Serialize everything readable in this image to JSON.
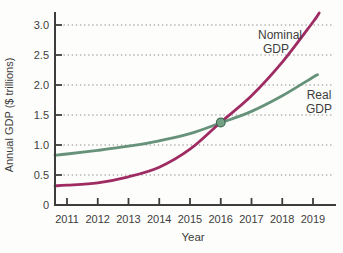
{
  "chart_data": {
    "type": "line",
    "title": "",
    "xlabel": "Year",
    "ylabel": "Annual GDP ($ trillions)",
    "x_tick_labels": [
      "2011",
      "2012",
      "2013",
      "2014",
      "2015",
      "2016",
      "2017",
      "2018",
      "2019"
    ],
    "x_tick_values": [
      2011,
      2012,
      2013,
      2014,
      2015,
      2016,
      2017,
      2018,
      2019
    ],
    "y_tick_labels": [
      "0",
      "0.5",
      "1.0",
      "1.5",
      "2.0",
      "2.5",
      "3.0"
    ],
    "y_tick_values": [
      0,
      0.5,
      1,
      1.5,
      2,
      2.5,
      3
    ],
    "xlim": [
      2010.6,
      2019.75
    ],
    "ylim": [
      0,
      3.22
    ],
    "grid": "horizontal-dotted",
    "legend_position": "inline-labels",
    "series": [
      {
        "name": "Nominal GDP",
        "color": "#9e2c63",
        "x": [
          2010.61,
          2011,
          2012,
          2013,
          2014,
          2015,
          2016,
          2017,
          2018,
          2019,
          2019.2
        ],
        "values": [
          0.32,
          0.33,
          0.37,
          0.47,
          0.63,
          0.93,
          1.38,
          1.82,
          2.38,
          3.05,
          3.2
        ]
      },
      {
        "name": "Real GDP",
        "color": "#67927a",
        "x": [
          2010.61,
          2011,
          2012,
          2013,
          2014,
          2015,
          2016,
          2017,
          2018,
          2019,
          2019.15
        ],
        "values": [
          0.83,
          0.85,
          0.91,
          0.98,
          1.07,
          1.19,
          1.37,
          1.56,
          1.82,
          2.13,
          2.17
        ]
      }
    ],
    "intersection_marker": {
      "x": 2016,
      "y": 1.375
    }
  },
  "labels": {
    "y_axis": "Annual GDP ($ trillions)",
    "x_axis": "Year",
    "nominal": {
      "line1": "Nominal",
      "line2": "GDP"
    },
    "real": {
      "line1": "Real",
      "line2": "GDP"
    }
  },
  "colors": {
    "nominal_line": "#9e2c63",
    "real_line": "#67927a",
    "marker_fill": "#74a184",
    "marker_stroke": "#3f6e55",
    "axis": "#3d3d3d",
    "grid": "#8f8f8f",
    "text": "#3d3d3d",
    "background": "#fdfdfc"
  }
}
